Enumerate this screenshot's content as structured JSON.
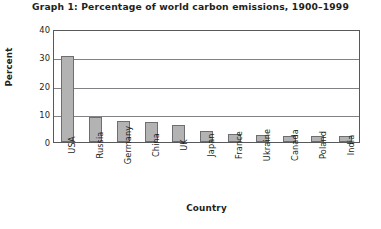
{
  "chart_data": {
    "type": "bar",
    "title": "Graph 1: Percentage of world carbon emissions, 1900–1999",
    "xlabel": "Country",
    "ylabel": "Percent",
    "categories": [
      "USA",
      "Russia",
      "Germany",
      "China",
      "UK",
      "Japan",
      "France",
      "Ukraine",
      "Canada",
      "Poland",
      "India"
    ],
    "values": [
      30.5,
      8.9,
      7.4,
      7.0,
      6.0,
      3.9,
      2.9,
      2.6,
      2.3,
      2.2,
      2.1
    ],
    "ylim": [
      0,
      40
    ],
    "yticks": [
      0,
      10,
      20,
      30,
      40
    ],
    "ytick_labels": [
      "0",
      "10",
      "20",
      "30",
      "40"
    ],
    "gridlines": [
      10,
      20,
      30
    ],
    "grid": true,
    "legend": false,
    "bar_color": "#b3b3b3",
    "bar_border_color": "#6d6e71",
    "axis_color": "#58595b",
    "grid_color": "#808285",
    "text_color": "#231f20"
  }
}
